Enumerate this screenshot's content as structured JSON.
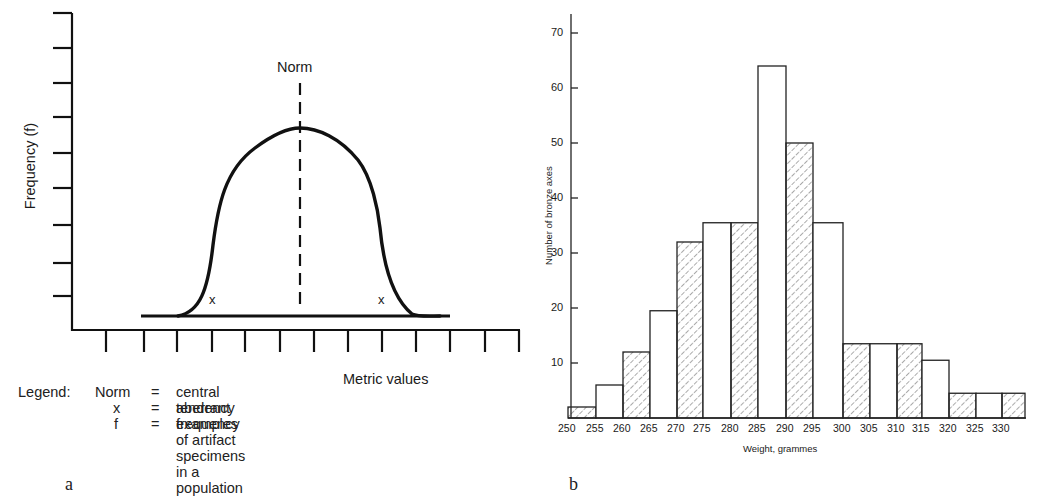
{
  "panel_a": {
    "label": "a",
    "y_axis_label": "Frequency (f)",
    "x_axis_label": "Metric values",
    "norm_label": "Norm",
    "aberrant_marker": "x",
    "legend": {
      "title": "Legend:",
      "items": [
        {
          "symbol": "Norm",
          "eq": "=",
          "text": "central tendency"
        },
        {
          "symbol": "x",
          "eq": "=",
          "text": "aberrant examples"
        },
        {
          "symbol": "f",
          "eq": "=",
          "text": "frequency of artifact specimens in a population"
        }
      ]
    }
  },
  "panel_b": {
    "label": "b",
    "y_axis_label": "Number of bronze axes",
    "x_axis_label": "Weight, grammes",
    "y_ticks": [
      "10",
      "20",
      "30",
      "40",
      "50",
      "60",
      "70"
    ],
    "x_ticks": [
      "250",
      "255",
      "260",
      "265",
      "270",
      "275",
      "280",
      "285",
      "290",
      "295",
      "300",
      "305",
      "310",
      "315",
      "320",
      "325",
      "330"
    ]
  },
  "chart_data": [
    {
      "type": "line",
      "title": "",
      "xlabel": "Metric values",
      "ylabel": "Frequency (f)",
      "description": "Schematic bell-shaped (normal) frequency curve with dashed vertical line marking the Norm (central tendency); 'x' marks aberrant examples in both tails",
      "annotations": [
        "Norm",
        "x",
        "x"
      ],
      "grid": false,
      "y_ticks_count": 9,
      "x_ticks_count": 13,
      "legend": [
        "Norm = central tendency",
        "x = aberrant examples",
        "f = frequency of artifact specimens in a population"
      ]
    },
    {
      "type": "bar",
      "title": "",
      "xlabel": "Weight, grammes",
      "ylabel": "Number of bronze axes",
      "categories": [
        "250",
        "255",
        "260",
        "265",
        "270",
        "275",
        "280",
        "285",
        "290",
        "295",
        "300",
        "305",
        "310",
        "315",
        "320",
        "325",
        "330"
      ],
      "values": [
        2,
        6,
        12,
        19.5,
        32,
        35.5,
        35.5,
        64,
        50,
        35.5,
        13.5,
        13.5,
        13.5,
        10.5,
        4.5,
        4.5,
        4.5
      ],
      "hatched": [
        true,
        false,
        true,
        false,
        true,
        false,
        true,
        false,
        true,
        false,
        true,
        false,
        true,
        false,
        true,
        false,
        true
      ],
      "ylim": [
        0,
        73
      ],
      "y_ticks": [
        10,
        20,
        30,
        40,
        50,
        60,
        70
      ],
      "grid": false,
      "legend": []
    }
  ]
}
